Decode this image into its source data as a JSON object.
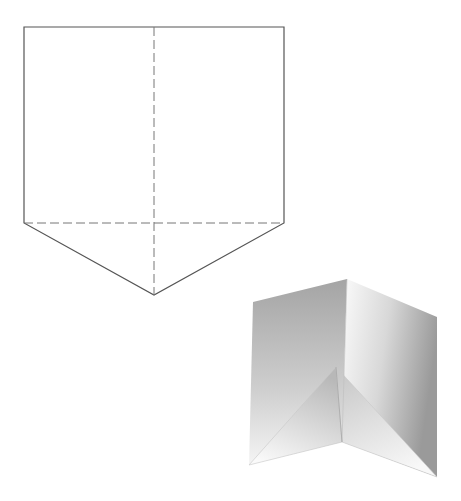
{
  "diagram": {
    "colors": {
      "background": "#ffffff",
      "line": "#555555",
      "fold_line": "#777777",
      "shade_dark": "#a8a8a8",
      "shade_light": "#f4f4f4"
    },
    "net": {
      "outline": [
        [
          24,
          27
        ],
        [
          284,
          27
        ],
        [
          284,
          223
        ],
        [
          154,
          295
        ],
        [
          24,
          223
        ]
      ],
      "fold_lines": [
        {
          "from": [
            154,
            27
          ],
          "to": [
            154,
            295
          ],
          "style": "dashed"
        },
        {
          "from": [
            24,
            223
          ],
          "to": [
            284,
            223
          ],
          "style": "dashed"
        }
      ]
    },
    "folded_shape": {
      "left_panel": [
        [
          253,
          302
        ],
        [
          347,
          279
        ],
        [
          342,
          442
        ],
        [
          249,
          465
        ]
      ],
      "right_panel": [
        [
          347,
          279
        ],
        [
          437,
          317
        ],
        [
          437,
          477
        ],
        [
          342,
          442
        ]
      ],
      "left_flap": [
        [
          336,
          367
        ],
        [
          342,
          442
        ],
        [
          249,
          465
        ]
      ],
      "right_flap": [
        [
          336,
          367
        ],
        [
          437,
          477
        ],
        [
          342,
          442
        ]
      ]
    }
  }
}
